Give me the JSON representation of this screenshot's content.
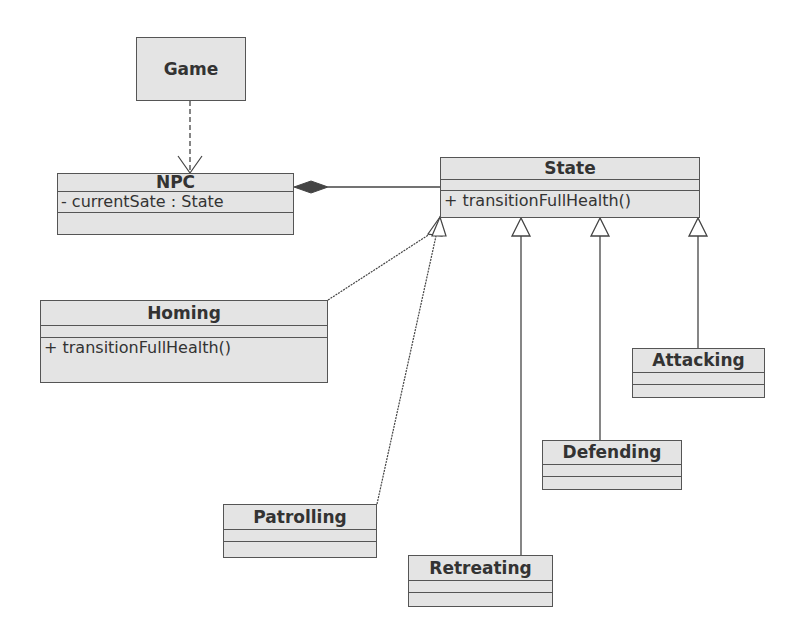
{
  "diagram": {
    "type": "UML class diagram",
    "classes": {
      "game": {
        "name": "Game"
      },
      "npc": {
        "name": "NPC",
        "attributes": [
          "- currentSate : State"
        ],
        "operations": []
      },
      "state": {
        "name": "State",
        "attributes": [],
        "operations": [
          "+ transitionFullHealth()"
        ]
      },
      "homing": {
        "name": "Homing",
        "attributes": [],
        "operations": [
          "+ transitionFullHealth()"
        ]
      },
      "attacking": {
        "name": "Attacking"
      },
      "defending": {
        "name": "Defending"
      },
      "patrolling": {
        "name": "Patrolling"
      },
      "retreating": {
        "name": "Retreating"
      }
    },
    "relationships": [
      {
        "from": "Game",
        "to": "NPC",
        "type": "dependency"
      },
      {
        "from": "NPC",
        "to": "State",
        "type": "composition"
      },
      {
        "from": "Homing",
        "to": "State",
        "type": "generalization"
      },
      {
        "from": "Patrolling",
        "to": "State",
        "type": "generalization"
      },
      {
        "from": "Retreating",
        "to": "State",
        "type": "generalization"
      },
      {
        "from": "Defending",
        "to": "State",
        "type": "generalization"
      },
      {
        "from": "Attacking",
        "to": "State",
        "type": "generalization"
      }
    ],
    "colors": {
      "box_fill": "#e4e4e4",
      "border": "#555555",
      "text": "#333333",
      "line": "#444444"
    }
  }
}
